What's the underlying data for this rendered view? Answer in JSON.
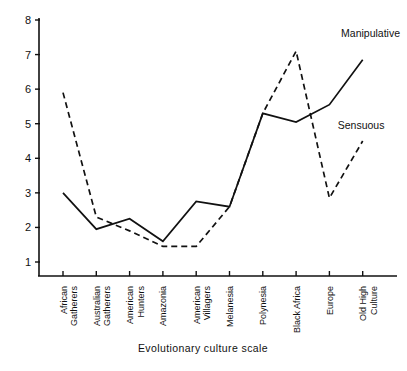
{
  "chart_data": {
    "type": "line",
    "title": "",
    "xlabel": "Evolutionary culture scale",
    "ylabel": "",
    "categories": [
      "African Gatherers",
      "Australian Gatherers",
      "American Hunters",
      "Amazonia",
      "American Villagers",
      "Melanesia",
      "Polynesia",
      "Black Africa",
      "Europe",
      "Old High Culture"
    ],
    "category_lines": [
      [
        "African",
        "Gatherers"
      ],
      [
        "Australian",
        "Gatherers"
      ],
      [
        "American",
        "Hunters"
      ],
      [
        "Amazonia"
      ],
      [
        "American",
        "Villagers"
      ],
      [
        "Melanesia"
      ],
      [
        "Polynesia"
      ],
      [
        "Black Africa"
      ],
      [
        "Europe"
      ],
      [
        "Old High",
        "Culture"
      ]
    ],
    "ylim": [
      0.5,
      8
    ],
    "yticks": [
      1,
      2,
      3,
      4,
      5,
      6,
      7,
      8
    ],
    "ytick_labels": [
      "1",
      "2",
      "3",
      "4",
      "5",
      "6",
      "7",
      "8"
    ],
    "grid": false,
    "legend": "inline-annotations",
    "series": [
      {
        "name": "Manipulative",
        "style": "dashed",
        "color": "#111111",
        "values": [
          5.9,
          2.3,
          1.9,
          1.45,
          1.45,
          2.6,
          5.3,
          7.1,
          2.85,
          4.5
        ]
      },
      {
        "name": "Sensuous",
        "style": "solid",
        "color": "#111111",
        "values": [
          3.0,
          1.95,
          2.25,
          1.6,
          2.75,
          2.6,
          5.3,
          5.05,
          5.55,
          6.85
        ]
      }
    ],
    "annotations": [
      {
        "text": "Manipulative",
        "x": 8.35,
        "y": 7.5
      },
      {
        "text": "Sensuous",
        "x": 8.25,
        "y": 4.85
      }
    ]
  }
}
